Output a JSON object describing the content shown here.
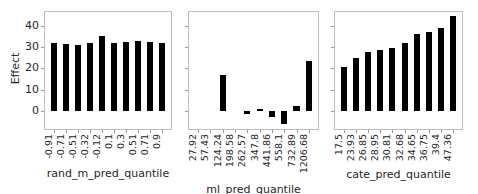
{
  "chart_data": [
    {
      "type": "bar",
      "title": "",
      "xlabel": "rand_m_pred_quantile",
      "ylabel": "Effect",
      "ylim": [
        -8,
        48
      ],
      "yticks": [
        0,
        10,
        20,
        30,
        40
      ],
      "categories": [
        "-0.91",
        "-0.71",
        "-0.51",
        "-0.32",
        "-0.12",
        "0.1",
        "0.3",
        "0.51",
        "0.71",
        "0.9"
      ],
      "values": [
        32,
        31.5,
        31,
        31.8,
        35,
        31.8,
        32.5,
        32.8,
        32.3,
        32
      ],
      "grid": false,
      "legend": null
    },
    {
      "type": "bar",
      "title": "",
      "xlabel": "ml_pred_quantile",
      "ylabel": "",
      "ylim": [
        -8,
        48
      ],
      "yticks": [
        0,
        10,
        20,
        30,
        40
      ],
      "categories": [
        "27.92",
        "57.43",
        "124.24",
        "198.58",
        "262.57",
        "347.8",
        "441.86",
        "558.1",
        "732.89",
        "1206.68"
      ],
      "values": [
        0,
        0,
        17,
        0,
        -1.5,
        1,
        -3,
        -6,
        2.5,
        23.5
      ],
      "grid": false,
      "legend": null
    },
    {
      "type": "bar",
      "title": "",
      "xlabel": "cate_pred_quantile",
      "ylabel": "",
      "ylim": [
        -8,
        48
      ],
      "yticks": [
        0,
        10,
        20,
        30,
        40
      ],
      "categories": [
        "17.5",
        "23.93",
        "26.85",
        "28.95",
        "30.81",
        "32.68",
        "34.65",
        "36.75",
        "39.4",
        "47.36"
      ],
      "values": [
        20.5,
        25,
        27.5,
        28.5,
        29.5,
        32,
        36,
        37,
        39,
        44.5
      ],
      "grid": false,
      "legend": null
    }
  ],
  "panels": [
    {
      "xlabel": "rand_m_pred_quantile",
      "ylabel": "Effect",
      "show_ytick_labels": true
    },
    {
      "xlabel": "ml_pred_quantile",
      "ylabel": "",
      "show_ytick_labels": false
    },
    {
      "xlabel": "cate_pred_quantile",
      "ylabel": "",
      "show_ytick_labels": false
    }
  ],
  "colors": {
    "bar": "#000000",
    "frame": "#bdbdbd",
    "text": "#262626"
  }
}
